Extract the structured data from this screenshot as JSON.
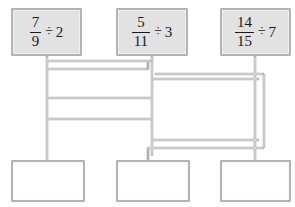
{
  "diagram": {
    "colors": {
      "wire": "#b0b0b0",
      "wire_inner": "#e8e8e8",
      "top_box_fill": "#e2e2e2",
      "bottom_box_fill": "#ffffff",
      "box_border": "#b3b3b3",
      "text": "#1a1a1a",
      "background": "#ffffff"
    },
    "top_nodes": [
      {
        "id": "expr-1",
        "numerator": "7",
        "denominator": "9",
        "operator": "÷",
        "divisor": "2",
        "text": "7/9 ÷ 2",
        "x": 11,
        "y": 8,
        "w": 71,
        "h": 48
      },
      {
        "id": "expr-2",
        "numerator": "5",
        "denominator": "11",
        "operator": "÷",
        "divisor": "3",
        "text": "5/11 ÷ 3",
        "x": 116,
        "y": 8,
        "w": 72,
        "h": 48
      },
      {
        "id": "expr-3",
        "numerator": "14",
        "denominator": "15",
        "operator": "÷",
        "divisor": "7",
        "text": "14/15 ÷ 7",
        "x": 220,
        "y": 8,
        "w": 71,
        "h": 48
      }
    ],
    "bottom_nodes": [
      {
        "id": "answer-1",
        "text": "",
        "x": 11,
        "y": 160,
        "w": 74,
        "h": 42
      },
      {
        "id": "answer-2",
        "text": "",
        "x": 116,
        "y": 160,
        "w": 74,
        "h": 42
      },
      {
        "id": "answer-3",
        "text": "",
        "x": 220,
        "y": 160,
        "w": 71,
        "h": 42
      }
    ],
    "wires": [
      {
        "id": "wire-left-trunk",
        "points": "47,56 47,163"
      },
      {
        "id": "wire-left-b1",
        "points": "47,61 151,61"
      },
      {
        "id": "wire-left-b2",
        "points": "47,69 148,69"
      },
      {
        "id": "wire-left-b3",
        "points": "47,98 152,98"
      },
      {
        "id": "wire-left-b4",
        "points": "47,119 152,119"
      },
      {
        "id": "wire-mid-trunk",
        "points": "152,56 152,155"
      },
      {
        "id": "wire-mid-stub",
        "points": "148,69 148,62"
      },
      {
        "id": "wire-mid-b1",
        "points": "152,79 259,79"
      },
      {
        "id": "wire-mid-b2",
        "points": "152,140 259,140"
      },
      {
        "id": "wire-mid-bottom",
        "points": "148,148 264,148"
      },
      {
        "id": "wire-right-trunk",
        "points": "255,56 255,163"
      },
      {
        "id": "wire-right-outer",
        "points": "264,74 264,148"
      },
      {
        "id": "wire-right-b1",
        "points": "155,74 264,74"
      },
      {
        "id": "wire-bottom-stub-2",
        "points": "148,148 148,161"
      }
    ]
  }
}
